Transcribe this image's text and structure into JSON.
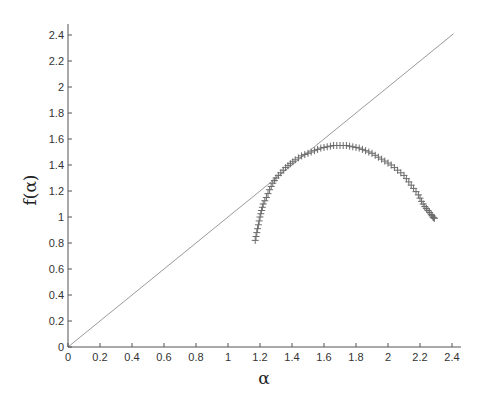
{
  "chart_data": {
    "type": "scatter",
    "title": "",
    "xlabel": "α",
    "ylabel": "f(α)",
    "xlim": [
      0,
      2.5
    ],
    "ylim": [
      0,
      2.5
    ],
    "grid": false,
    "legend": null,
    "xticks": [
      0,
      0.2,
      0.4,
      0.6,
      0.8,
      1,
      1.2,
      1.4,
      1.6,
      1.8,
      2,
      2.2,
      2.4
    ],
    "xtick_labels": [
      "0",
      "0.2",
      "0.4",
      "0.6",
      "0.8",
      "1",
      "1.2",
      "1.4",
      "1.6",
      "1.8",
      "2",
      "2.2",
      "2.4"
    ],
    "yticks": [
      0,
      0.2,
      0.4,
      0.6,
      0.8,
      1,
      1.2,
      1.4,
      1.6,
      1.8,
      2,
      2.2,
      2.4
    ],
    "ytick_labels": [
      "0",
      "0.2",
      "0.4",
      "0.6",
      "0.8",
      "1",
      "1.2",
      "1.4",
      "1.6",
      "1.8",
      "2",
      "2.2",
      "2.4"
    ],
    "series": [
      {
        "name": "f(alpha) spectrum",
        "marker": "+",
        "color": "#6b6b6b",
        "points": [
          [
            1.17,
            0.82
          ],
          [
            1.18,
            0.88
          ],
          [
            1.19,
            0.94
          ],
          [
            1.2,
            1.0
          ],
          [
            1.21,
            1.05
          ],
          [
            1.22,
            1.1
          ],
          [
            1.24,
            1.15
          ],
          [
            1.26,
            1.21
          ],
          [
            1.28,
            1.26
          ],
          [
            1.3,
            1.3
          ],
          [
            1.33,
            1.34
          ],
          [
            1.36,
            1.38
          ],
          [
            1.39,
            1.41
          ],
          [
            1.42,
            1.44
          ],
          [
            1.46,
            1.47
          ],
          [
            1.5,
            1.49
          ],
          [
            1.54,
            1.51
          ],
          [
            1.58,
            1.53
          ],
          [
            1.62,
            1.54
          ],
          [
            1.66,
            1.55
          ],
          [
            1.7,
            1.55
          ],
          [
            1.74,
            1.55
          ],
          [
            1.78,
            1.54
          ],
          [
            1.82,
            1.53
          ],
          [
            1.86,
            1.51
          ],
          [
            1.9,
            1.49
          ],
          [
            1.94,
            1.46
          ],
          [
            1.98,
            1.43
          ],
          [
            2.02,
            1.4
          ],
          [
            2.06,
            1.36
          ],
          [
            2.1,
            1.32
          ],
          [
            2.13,
            1.27
          ],
          [
            2.16,
            1.22
          ],
          [
            2.19,
            1.17
          ],
          [
            2.21,
            1.12
          ],
          [
            2.23,
            1.08
          ],
          [
            2.25,
            1.05
          ],
          [
            2.27,
            1.02
          ],
          [
            2.28,
            1.0
          ],
          [
            2.29,
            0.99
          ]
        ]
      },
      {
        "name": "reference line f(alpha)=alpha",
        "type": "line",
        "color": "#9a9a9a",
        "points": [
          [
            0,
            0
          ],
          [
            2.41,
            2.41
          ]
        ]
      }
    ]
  }
}
